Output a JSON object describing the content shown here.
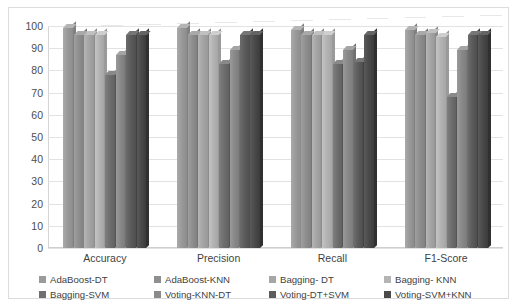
{
  "chart_data": {
    "type": "bar",
    "title": "",
    "xlabel": "",
    "ylabel": "",
    "ylim": [
      0,
      100
    ],
    "ytick_step": 10,
    "yticks": [
      100,
      90,
      80,
      70,
      60,
      50,
      40,
      30,
      20,
      10,
      0
    ],
    "grid": true,
    "legend_position": "bottom",
    "style": "3d-column-grayscale",
    "categories": [
      "Accuracy",
      "Precision",
      "Recall",
      "F1-Score"
    ],
    "series": [
      {
        "name": "AdaBoost-DT",
        "color": "#9a9a9a",
        "values": [
          99,
          99,
          98,
          98
        ]
      },
      {
        "name": "AdaBoost-KNN",
        "color": "#8f8f8f",
        "values": [
          96,
          96,
          96,
          96
        ]
      },
      {
        "name": "Bagging- DT",
        "color": "#a6a6a6",
        "values": [
          96,
          96,
          96,
          97
        ]
      },
      {
        "name": "Bagging- KNN",
        "color": "#b4b4b4",
        "values": [
          96,
          96,
          96,
          95
        ]
      },
      {
        "name": "Bagging-SVM",
        "color": "#6f6f6f",
        "values": [
          78,
          83,
          83,
          68
        ]
      },
      {
        "name": "Voting-KNN-DT",
        "color": "#8a8a8a",
        "values": [
          87,
          89,
          89,
          89
        ]
      },
      {
        "name": "Voting-DT+SVM",
        "color": "#5c5c5c",
        "values": [
          96,
          96,
          84,
          96
        ]
      },
      {
        "name": "Voting-SVM+KNN",
        "color": "#4a4a4a",
        "values": [
          96,
          96,
          96,
          96
        ]
      }
    ]
  },
  "legend": {
    "items": [
      {
        "label": "AdaBoost-DT"
      },
      {
        "label": "AdaBoost-KNN"
      },
      {
        "label": "Bagging- DT"
      },
      {
        "label": "Bagging- KNN"
      },
      {
        "label": "Bagging-SVM"
      },
      {
        "label": "Voting-KNN-DT"
      },
      {
        "label": "Voting-DT+SVM"
      },
      {
        "label": "Voting-SVM+KNN"
      }
    ]
  }
}
